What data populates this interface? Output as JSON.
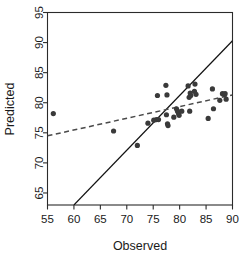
{
  "chart_data": {
    "type": "scatter",
    "title": "",
    "xlabel": "Observed",
    "ylabel": "Predicted",
    "xlim": [
      55,
      90
    ],
    "ylim": [
      63,
      95
    ],
    "xticks": [
      55,
      60,
      65,
      70,
      75,
      80,
      85,
      90
    ],
    "yticks": [
      65,
      70,
      75,
      80,
      85,
      90,
      95
    ],
    "xtick_labels": [
      "55",
      "60",
      "65",
      "70",
      "75",
      "80",
      "85",
      "90"
    ],
    "ytick_labels": [
      "65",
      "70",
      "75",
      "80",
      "85",
      "90",
      "95"
    ],
    "grid": false,
    "legend": "none",
    "point_color": "#3a3a3a",
    "point_radius": 2.6,
    "points": [
      {
        "x": 56.1,
        "y": 78.2
      },
      {
        "x": 67.5,
        "y": 75.3
      },
      {
        "x": 72.0,
        "y": 72.9
      },
      {
        "x": 74.0,
        "y": 76.6
      },
      {
        "x": 75.1,
        "y": 77.1
      },
      {
        "x": 75.6,
        "y": 77.2
      },
      {
        "x": 76.0,
        "y": 77.2
      },
      {
        "x": 75.8,
        "y": 81.2
      },
      {
        "x": 77.4,
        "y": 82.9
      },
      {
        "x": 77.6,
        "y": 81.3
      },
      {
        "x": 77.5,
        "y": 78.0
      },
      {
        "x": 77.7,
        "y": 76.5
      },
      {
        "x": 77.8,
        "y": 76.2
      },
      {
        "x": 78.9,
        "y": 77.6
      },
      {
        "x": 79.4,
        "y": 79.0
      },
      {
        "x": 79.6,
        "y": 78.6
      },
      {
        "x": 79.8,
        "y": 78.2
      },
      {
        "x": 79.9,
        "y": 77.9
      },
      {
        "x": 80.4,
        "y": 78.6
      },
      {
        "x": 81.6,
        "y": 82.8
      },
      {
        "x": 81.8,
        "y": 80.9
      },
      {
        "x": 82.0,
        "y": 81.6
      },
      {
        "x": 82.1,
        "y": 81.2
      },
      {
        "x": 81.9,
        "y": 78.6
      },
      {
        "x": 82.9,
        "y": 83.1
      },
      {
        "x": 82.8,
        "y": 81.9
      },
      {
        "x": 83.1,
        "y": 81.4
      },
      {
        "x": 85.4,
        "y": 77.4
      },
      {
        "x": 86.2,
        "y": 82.3
      },
      {
        "x": 86.4,
        "y": 79.0
      },
      {
        "x": 87.6,
        "y": 80.4
      },
      {
        "x": 88.1,
        "y": 81.5
      },
      {
        "x": 88.4,
        "y": 81.4
      },
      {
        "x": 88.6,
        "y": 81.5
      },
      {
        "x": 88.8,
        "y": 80.6
      }
    ],
    "lines": [
      {
        "name": "identity-line",
        "style": "solid",
        "color": "#111111",
        "x0": 60.0,
        "y0": 63.0,
        "x1": 90.0,
        "y1": 90.3
      },
      {
        "name": "fit-line",
        "style": "dashed",
        "color": "#4a4a4a",
        "x0": 55.0,
        "y0": 74.5,
        "x1": 90.0,
        "y1": 81.3
      }
    ]
  }
}
